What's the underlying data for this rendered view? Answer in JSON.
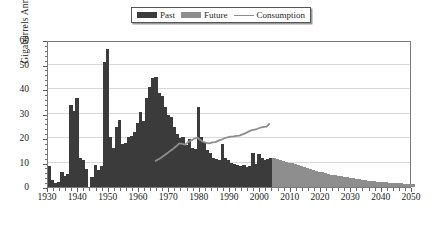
{
  "legend": {
    "position": "top-center",
    "items": [
      {
        "label": "Past",
        "marker": "swatch",
        "color": "#3b3b3b"
      },
      {
        "label": "Future",
        "marker": "swatch",
        "color": "#8e8e8e"
      },
      {
        "label": "Consumption",
        "marker": "line",
        "color": "#8d8d8d"
      }
    ]
  },
  "chart_data": {
    "type": "bar",
    "title": "",
    "subtitle": "",
    "xlabel": "",
    "ylabel": "Gigabarrels Annually",
    "xlim": [
      1930,
      2050
    ],
    "ylim": [
      0,
      60
    ],
    "grid": true,
    "legend_position": "top-center",
    "x_ticks": [
      1930,
      1940,
      1950,
      1960,
      1970,
      1980,
      1990,
      2000,
      2010,
      2020,
      2030,
      2040,
      2050
    ],
    "y_ticks": [
      0,
      10,
      20,
      30,
      40,
      50,
      60
    ],
    "x_minor_step": 2,
    "y_minor_step": 2,
    "split_year": 2003,
    "colors": {
      "past": "#3b3b3b",
      "future": "#8e8e8e",
      "consumption": "#8d8d8d",
      "grid": "#d8d8d8",
      "frame": "#7a7a7a"
    },
    "series": [
      {
        "name": "Past",
        "type": "bar",
        "color": "#3b3b3b",
        "x": [
          1930,
          1931,
          1932,
          1933,
          1934,
          1935,
          1936,
          1937,
          1938,
          1939,
          1940,
          1941,
          1942,
          1943,
          1944,
          1945,
          1946,
          1947,
          1948,
          1949,
          1950,
          1951,
          1952,
          1953,
          1954,
          1955,
          1956,
          1957,
          1958,
          1959,
          1960,
          1961,
          1962,
          1963,
          1964,
          1965,
          1966,
          1967,
          1968,
          1969,
          1970,
          1971,
          1972,
          1973,
          1974,
          1975,
          1976,
          1977,
          1978,
          1979,
          1980,
          1981,
          1982,
          1983,
          1984,
          1985,
          1986,
          1987,
          1988,
          1989,
          1990,
          1991,
          1992,
          1993,
          1994,
          1995,
          1996,
          1997,
          1998,
          1999,
          2000,
          2001,
          2002,
          2003
        ],
        "values": [
          8.5,
          3.0,
          1.5,
          2.0,
          6.0,
          4.5,
          5.5,
          33.5,
          31.0,
          36.5,
          12.0,
          11.0,
          7.5,
          0.0,
          4.0,
          9.0,
          7.0,
          8.5,
          51.0,
          56.5,
          20.5,
          16.0,
          24.5,
          27.5,
          17.5,
          18.0,
          20.5,
          21.0,
          22.5,
          26.0,
          30.5,
          27.0,
          36.5,
          41.0,
          44.5,
          45.0,
          38.5,
          37.0,
          32.5,
          29.5,
          28.5,
          24.5,
          21.5,
          20.0,
          20.5,
          17.0,
          19.5,
          16.0,
          15.5,
          32.5,
          20.5,
          18.5,
          15.0,
          14.0,
          12.0,
          11.5,
          11.0,
          17.5,
          12.0,
          11.0,
          10.0,
          9.5,
          9.0,
          8.5,
          9.0,
          8.0,
          8.5,
          14.0,
          9.5,
          13.5,
          12.0,
          11.0,
          11.5,
          12.0
        ]
      },
      {
        "name": "Future",
        "type": "bar",
        "color": "#8e8e8e",
        "x": [
          2004,
          2005,
          2006,
          2007,
          2008,
          2009,
          2010,
          2011,
          2012,
          2013,
          2014,
          2015,
          2016,
          2017,
          2018,
          2019,
          2020,
          2021,
          2022,
          2023,
          2024,
          2025,
          2026,
          2027,
          2028,
          2029,
          2030,
          2031,
          2032,
          2033,
          2034,
          2035,
          2036,
          2037,
          2038,
          2039,
          2040,
          2041,
          2042,
          2043,
          2044,
          2045,
          2046,
          2047,
          2048,
          2049,
          2050
        ],
        "values": [
          11.9,
          11.6,
          11.2,
          10.8,
          10.4,
          10.0,
          9.6,
          9.2,
          8.8,
          8.4,
          8.0,
          7.6,
          7.2,
          6.9,
          6.6,
          6.3,
          6.0,
          5.7,
          5.4,
          5.1,
          4.8,
          4.5,
          4.3,
          4.1,
          3.9,
          3.7,
          3.5,
          3.3,
          3.1,
          2.9,
          2.7,
          2.5,
          2.4,
          2.3,
          2.2,
          2.1,
          2.0,
          1.9,
          1.8,
          1.7,
          1.6,
          1.5,
          1.45,
          1.4,
          1.35,
          1.3,
          1.25
        ]
      },
      {
        "name": "Consumption",
        "type": "line",
        "color": "#8d8d8d",
        "x": [
          1965,
          1966,
          1967,
          1968,
          1969,
          1970,
          1971,
          1972,
          1973,
          1974,
          1975,
          1976,
          1977,
          1978,
          1979,
          1980,
          1981,
          1982,
          1983,
          1984,
          1985,
          1986,
          1987,
          1988,
          1989,
          1990,
          1991,
          1992,
          1993,
          1994,
          1995,
          1996,
          1997,
          1998,
          1999,
          2000,
          2001,
          2002,
          2003
        ],
        "values": [
          11.1,
          11.8,
          12.5,
          13.4,
          14.3,
          15.3,
          16.2,
          17.2,
          18.4,
          18.2,
          17.9,
          19.0,
          19.6,
          20.3,
          20.8,
          19.8,
          19.0,
          18.6,
          18.4,
          18.8,
          18.9,
          19.5,
          19.9,
          20.5,
          20.9,
          21.2,
          21.3,
          21.5,
          21.6,
          22.1,
          22.6,
          23.2,
          23.8,
          24.0,
          24.4,
          24.9,
          25.2,
          25.3,
          26.6
        ]
      }
    ]
  }
}
